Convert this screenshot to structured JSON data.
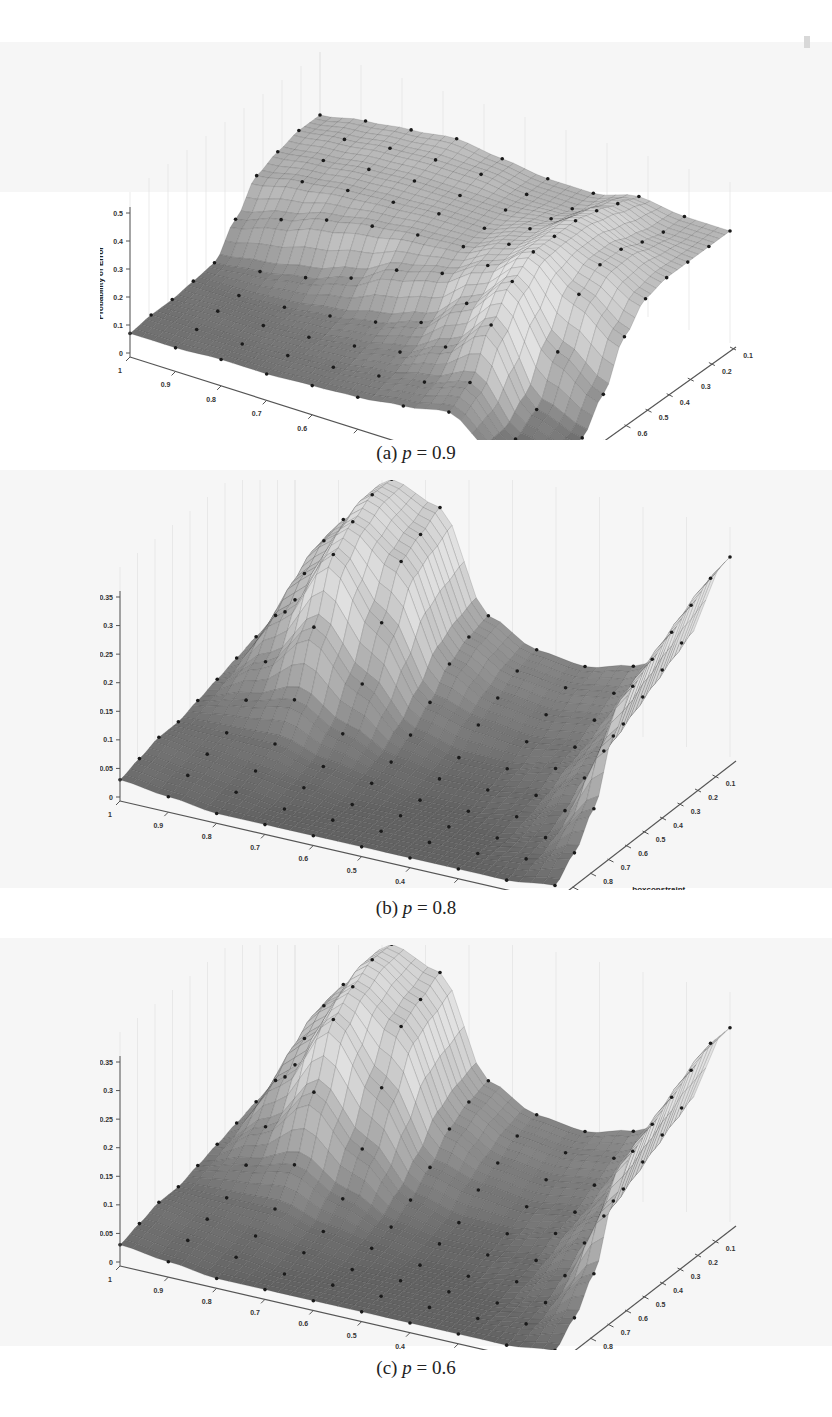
{
  "page": {
    "type": "scanned paper figure",
    "figure_count": 3
  },
  "panels": [
    {
      "id": "a",
      "caption_prefix": "(a) ",
      "caption_var": "p",
      "caption_eq": " = ",
      "caption_value": "0.9",
      "zlabel": "Probability of Error",
      "xlabel": "sigma",
      "ylabel": "boxconstraint",
      "zticks": [
        "0",
        "0.1",
        "0.2",
        "0.3",
        "0.4",
        "0.5"
      ],
      "xticks": [
        "1",
        "0.9",
        "0.8",
        "0.7",
        "0.6",
        "0.5",
        "0.4",
        "0.3",
        "0.2",
        "0.1"
      ],
      "yticks": [
        "1",
        "0.9",
        "0.8",
        "0.7",
        "0.6",
        "0.5",
        "0.4",
        "0.3",
        "0.2",
        "0.1"
      ]
    },
    {
      "id": "b",
      "caption_prefix": "(b) ",
      "caption_var": "p",
      "caption_eq": " = ",
      "caption_value": "0.8",
      "zlabel": "Probability of Error",
      "xlabel": "sigma",
      "ylabel": "boxconstraint",
      "zticks": [
        "0",
        "0.05",
        "0.1",
        "0.15",
        "0.2",
        "0.25",
        "0.3",
        "0.35"
      ],
      "xticks": [
        "1",
        "0.9",
        "0.8",
        "0.7",
        "0.6",
        "0.5",
        "0.4",
        "0.3",
        "0.2",
        "0.1"
      ],
      "yticks": [
        "0.9",
        "0.8",
        "0.7",
        "0.6",
        "0.5",
        "0.4",
        "0.3",
        "0.2",
        "0.1"
      ]
    },
    {
      "id": "c",
      "caption_prefix": "(c) ",
      "caption_var": "p",
      "caption_eq": " = ",
      "caption_value": "0.6",
      "zlabel": "Probability of Error",
      "xlabel": "sigma",
      "ylabel": "boxconstraint",
      "zticks": [
        "0",
        "0.05",
        "0.1",
        "0.15",
        "0.2",
        "0.25",
        "0.3",
        "0.35"
      ],
      "xticks": [
        "1",
        "0.9",
        "0.8",
        "0.7",
        "0.6",
        "0.5",
        "0.4",
        "0.3",
        "0.2",
        "0.1"
      ],
      "yticks": [
        "0.9",
        "0.8",
        "0.7",
        "0.6",
        "0.5",
        "0.4",
        "0.3",
        "0.2",
        "0.1"
      ]
    }
  ],
  "chart_data": [
    {
      "type": "surface",
      "title": "(a) p = 0.9",
      "xlabel": "sigma",
      "ylabel": "boxconstraint",
      "zlabel": "Probability of Error",
      "x": [
        1,
        0.9,
        0.8,
        0.7,
        0.6,
        0.5,
        0.4,
        0.3,
        0.2,
        0.1
      ],
      "y": [
        1,
        0.9,
        0.8,
        0.7,
        0.6,
        0.5,
        0.4,
        0.3,
        0.2,
        0.1
      ],
      "zlim": [
        0,
        0.5
      ],
      "grid": true,
      "description": "Low plateau (~0.05-0.1) for large sigma; high plateau ~0.4-0.5 for small boxconstraint; sharp ridge peaking ~0.5 near sigma 0.2-0.3; trough near 0 at sigma 0.1-0.2, boxconstraint 0.9-1",
      "z": [
        [
          0.07,
          0.07,
          0.08,
          0.08,
          0.09,
          0.1,
          0.12,
          0.15,
          0.05,
          0.02
        ],
        [
          0.08,
          0.08,
          0.08,
          0.09,
          0.1,
          0.12,
          0.15,
          0.2,
          0.05,
          0.02
        ],
        [
          0.08,
          0.09,
          0.09,
          0.1,
          0.12,
          0.15,
          0.22,
          0.35,
          0.1,
          0.05
        ],
        [
          0.09,
          0.09,
          0.1,
          0.12,
          0.15,
          0.2,
          0.32,
          0.45,
          0.25,
          0.15
        ],
        [
          0.1,
          0.12,
          0.15,
          0.2,
          0.28,
          0.32,
          0.4,
          0.5,
          0.4,
          0.3
        ],
        [
          0.2,
          0.25,
          0.3,
          0.33,
          0.35,
          0.36,
          0.42,
          0.5,
          0.45,
          0.38
        ],
        [
          0.3,
          0.33,
          0.35,
          0.36,
          0.37,
          0.37,
          0.42,
          0.5,
          0.45,
          0.4
        ],
        [
          0.33,
          0.35,
          0.37,
          0.38,
          0.38,
          0.38,
          0.4,
          0.48,
          0.42,
          0.4
        ],
        [
          0.35,
          0.37,
          0.39,
          0.4,
          0.4,
          0.38,
          0.38,
          0.45,
          0.4,
          0.4
        ],
        [
          0.35,
          0.38,
          0.4,
          0.42,
          0.4,
          0.38,
          0.38,
          0.42,
          0.4,
          0.4
        ]
      ]
    },
    {
      "type": "surface",
      "title": "(b) p = 0.8",
      "xlabel": "sigma",
      "ylabel": "boxconstraint",
      "zlabel": "Probability of Error",
      "x": [
        1,
        0.9,
        0.8,
        0.7,
        0.6,
        0.5,
        0.4,
        0.3,
        0.2,
        0.1
      ],
      "y": [
        1,
        0.9,
        0.8,
        0.7,
        0.6,
        0.5,
        0.4,
        0.3,
        0.2,
        0.1
      ],
      "zlim": [
        0,
        0.35
      ],
      "grid": true,
      "description": "Mostly flat near 0 with a broad peak ~0.33 around sigma 0.8-0.7 at low boxconstraint, and a second rise ~0.35 at sigma 0.1, boxconstraint 0.1-0.3",
      "z": [
        [
          0.03,
          0.02,
          0.01,
          0.01,
          0.01,
          0.01,
          0.01,
          0.01,
          0.01,
          0.02
        ],
        [
          0.04,
          0.03,
          0.02,
          0.01,
          0.01,
          0.01,
          0.01,
          0.01,
          0.02,
          0.05
        ],
        [
          0.05,
          0.04,
          0.03,
          0.02,
          0.01,
          0.01,
          0.01,
          0.01,
          0.03,
          0.1
        ],
        [
          0.05,
          0.05,
          0.05,
          0.03,
          0.02,
          0.01,
          0.01,
          0.02,
          0.05,
          0.2
        ],
        [
          0.06,
          0.08,
          0.1,
          0.06,
          0.03,
          0.02,
          0.02,
          0.03,
          0.08,
          0.26
        ],
        [
          0.07,
          0.12,
          0.2,
          0.12,
          0.05,
          0.03,
          0.03,
          0.05,
          0.1,
          0.28
        ],
        [
          0.08,
          0.18,
          0.3,
          0.2,
          0.08,
          0.06,
          0.05,
          0.06,
          0.12,
          0.3
        ],
        [
          0.09,
          0.22,
          0.33,
          0.28,
          0.12,
          0.08,
          0.07,
          0.08,
          0.14,
          0.32
        ],
        [
          0.1,
          0.25,
          0.35,
          0.3,
          0.14,
          0.1,
          0.09,
          0.1,
          0.16,
          0.34
        ],
        [
          0.1,
          0.26,
          0.35,
          0.32,
          0.15,
          0.11,
          0.1,
          0.12,
          0.18,
          0.35
        ]
      ]
    },
    {
      "type": "surface",
      "title": "(c) p = 0.6",
      "xlabel": "sigma",
      "ylabel": "boxconstraint",
      "zlabel": "Probability of Error",
      "x": [
        1,
        0.9,
        0.8,
        0.7,
        0.6,
        0.5,
        0.4,
        0.3,
        0.2,
        0.1
      ],
      "y": [
        1,
        0.9,
        0.8,
        0.7,
        0.6,
        0.5,
        0.4,
        0.3,
        0.2,
        0.1
      ],
      "zlim": [
        0,
        0.35
      ],
      "grid": true,
      "description": "Nearly identical to (b): flat near 0 with a peak ~0.33 around sigma 0.8-0.7 at low boxconstraint and a rise ~0.35 at sigma 0.1, low boxconstraint",
      "z": [
        [
          0.03,
          0.02,
          0.01,
          0.01,
          0.01,
          0.01,
          0.01,
          0.01,
          0.01,
          0.02
        ],
        [
          0.04,
          0.03,
          0.02,
          0.01,
          0.01,
          0.01,
          0.01,
          0.01,
          0.02,
          0.05
        ],
        [
          0.05,
          0.04,
          0.03,
          0.02,
          0.01,
          0.01,
          0.01,
          0.01,
          0.03,
          0.1
        ],
        [
          0.05,
          0.05,
          0.05,
          0.03,
          0.02,
          0.01,
          0.01,
          0.02,
          0.05,
          0.2
        ],
        [
          0.06,
          0.08,
          0.1,
          0.06,
          0.03,
          0.02,
          0.02,
          0.03,
          0.08,
          0.26
        ],
        [
          0.07,
          0.12,
          0.2,
          0.12,
          0.05,
          0.03,
          0.03,
          0.05,
          0.1,
          0.28
        ],
        [
          0.08,
          0.18,
          0.3,
          0.2,
          0.08,
          0.06,
          0.05,
          0.06,
          0.12,
          0.3
        ],
        [
          0.09,
          0.22,
          0.33,
          0.28,
          0.12,
          0.08,
          0.07,
          0.08,
          0.14,
          0.32
        ],
        [
          0.1,
          0.25,
          0.35,
          0.3,
          0.14,
          0.1,
          0.09,
          0.1,
          0.16,
          0.34
        ],
        [
          0.1,
          0.26,
          0.35,
          0.32,
          0.15,
          0.11,
          0.1,
          0.12,
          0.18,
          0.34
        ]
      ]
    }
  ]
}
